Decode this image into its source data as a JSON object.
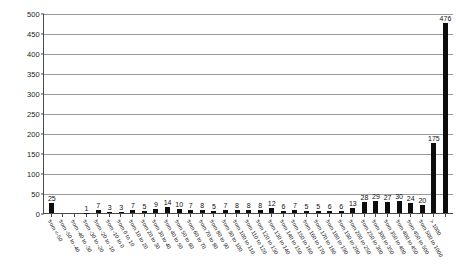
{
  "chart_data": {
    "type": "bar",
    "title": "",
    "subtitle": "",
    "xlabel": "",
    "ylabel": "",
    "ylim": [
      0,
      500
    ],
    "yticks": [
      0,
      50,
      100,
      150,
      200,
      250,
      300,
      350,
      400,
      450,
      500
    ],
    "grid": true,
    "legend": null,
    "bar_color": "#0d0d0d",
    "gridline_color": "#9a9a9a",
    "axis_color": "#4a4a4a",
    "show_value_labels": true,
    "categories": [
      "from <-50",
      "from -50 to -40",
      "from -40 to -30",
      "from -30 to -20",
      "from -20 to -10",
      "from -10 to 0",
      "from 0 to 10",
      "from 10 to 20",
      "from 20 to 30",
      "from 30 to 40",
      "from 40 to 50",
      "from 50 to 60",
      "from 60 to 70",
      "from 70 to 80",
      "from 80 to 90",
      "from 90 to 100",
      "from 100 to 110",
      "from 110 to 120",
      "from 120 to 130",
      "from 130 to 140",
      "from 140 to 150",
      "from 150 to 160",
      "from 160 to 170",
      "from 170 to 180",
      "from 180 to 190",
      "from 190 to 200",
      "from 200 to 250",
      "from 250 to 300",
      "from 300 to 350",
      "from 350 to 400",
      "from 400 to 450",
      "from 450 to 500",
      "from 500 to 1000",
      "> 1000"
    ],
    "values": [
      25,
      0,
      0,
      1,
      7,
      3,
      3,
      7,
      5,
      9,
      14,
      10,
      7,
      8,
      5,
      7,
      8,
      8,
      8,
      12,
      6,
      7,
      5,
      5,
      6,
      6,
      13,
      28,
      29,
      27,
      30,
      24,
      20,
      175
    ],
    "value_labels": [
      "25",
      "",
      "",
      "1",
      "7",
      "3",
      "3",
      "7",
      "5",
      "9",
      "14",
      "10",
      "7",
      "8",
      "5",
      "7",
      "8",
      "8",
      "8",
      "12",
      "6",
      "7",
      "5",
      "5",
      "6",
      "6",
      "13",
      "28",
      "29",
      "27",
      "30",
      "24",
      "20",
      "175"
    ],
    "extra_bar": {
      "label": "476",
      "value": 476
    }
  }
}
